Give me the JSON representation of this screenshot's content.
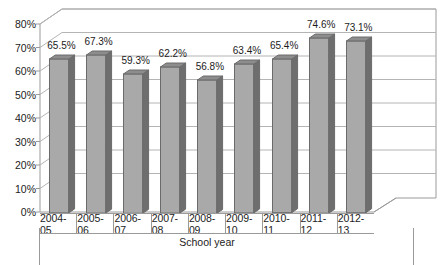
{
  "chart_data": {
    "type": "bar",
    "title": "",
    "subtitle": "",
    "xlabel": "School year",
    "ylabel": "",
    "categories": [
      "2004-05",
      "2005-06",
      "2006-07",
      "2007-08",
      "2008-09",
      "2009-10",
      "2010-11",
      "2011-12",
      "2012-13"
    ],
    "values": [
      65.5,
      67.3,
      59.3,
      62.2,
      56.8,
      63.4,
      65.4,
      74.6,
      73.1
    ],
    "data_labels": [
      "65.5%",
      "67.3%",
      "59.3%",
      "62.2%",
      "56.8%",
      "63.4%",
      "65.4%",
      "74.6%",
      "73.1%"
    ],
    "ylim": [
      0,
      80
    ],
    "ytick_step": 10,
    "ytick_labels": [
      "80%",
      "70%",
      "60%",
      "50%",
      "40%",
      "30%",
      "20%",
      "10%",
      "0%"
    ],
    "ytick_values": [
      80,
      70,
      60,
      50,
      40,
      30,
      20,
      10,
      0
    ],
    "grid": true,
    "grid_axis": "y",
    "legend": false,
    "legend_position": "none",
    "style": "3d-column",
    "series": [
      {
        "name": "",
        "values": [
          65.5,
          67.3,
          59.3,
          62.2,
          56.8,
          63.4,
          65.4,
          74.6,
          73.1
        ]
      }
    ]
  },
  "colors": {
    "bar_front": "#a9a9a9",
    "bar_side": "#6e6e6e",
    "bar_top": "#8d8d8d",
    "bar_outline": "#6b6b6b",
    "grid": "#b4b4b4",
    "axis": "#9a9a9a",
    "wall_back": "#ffffff",
    "floor": "#ffffff",
    "text": "#1c1c1c",
    "background": "#ffffff"
  },
  "axis": {
    "y_title": "",
    "x_title": "School year"
  }
}
